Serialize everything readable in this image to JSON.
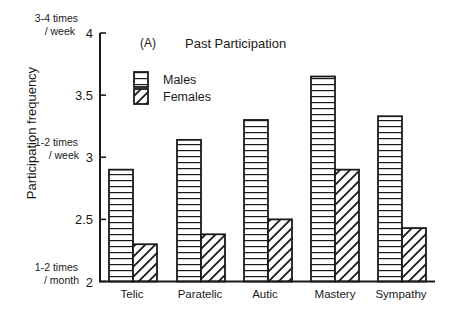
{
  "chart_data": {
    "type": "bar",
    "panel_label": "(A)",
    "title": "Past Participation",
    "xlabel": "",
    "ylabel": "Participation frequency",
    "ylim": [
      2,
      4
    ],
    "yticks": [
      2,
      2.5,
      3,
      3.5,
      4
    ],
    "ytick_labels": [
      "2",
      "2.5",
      "3",
      "3.5",
      "4"
    ],
    "ytick_annotations": [
      {
        "value": 4,
        "lines": [
          "3-4 times",
          "/ week"
        ]
      },
      {
        "value": 3,
        "lines": [
          "1-2 times",
          "/ week"
        ]
      },
      {
        "value": 2,
        "lines": [
          "1-2 times",
          "/ month"
        ]
      }
    ],
    "grid": false,
    "legend_position": "upper-left",
    "categories": [
      "Telic",
      "Paratelic",
      "Autic",
      "Mastery",
      "Sympathy"
    ],
    "series": [
      {
        "name": "Males",
        "pattern": "horizontal-stripes",
        "values": [
          2.9,
          3.14,
          3.3,
          3.65,
          3.33
        ]
      },
      {
        "name": "Females",
        "pattern": "diagonal-hatch",
        "values": [
          2.3,
          2.38,
          2.5,
          2.9,
          2.43
        ]
      }
    ]
  },
  "colors": {
    "ink": "#1a1a1a",
    "background": "#ffffff"
  }
}
